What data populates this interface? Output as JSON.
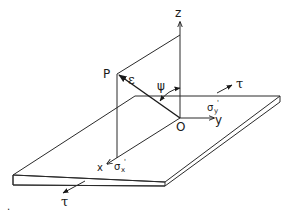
{
  "figure": {
    "colors": {
      "line": "#2a2a2a",
      "background": "#ffffff"
    }
  },
  "axes": {
    "z_label": "z",
    "y_label": "y",
    "x_label": "x",
    "origin_label": "O"
  },
  "point": {
    "label": "P"
  },
  "vectors": {
    "strain_label": "ε",
    "angle_label": "ψ"
  },
  "stresses": {
    "sigma_x_symbol": "σ",
    "sigma_x_sub": "x",
    "sigma_x_prime": "'",
    "sigma_y_symbol": "σ",
    "sigma_y_sub": "y",
    "sigma_y_prime": "'",
    "shear_back_label": "τ",
    "shear_front_label": "τ"
  },
  "marks": {
    "stray_dot": "."
  }
}
